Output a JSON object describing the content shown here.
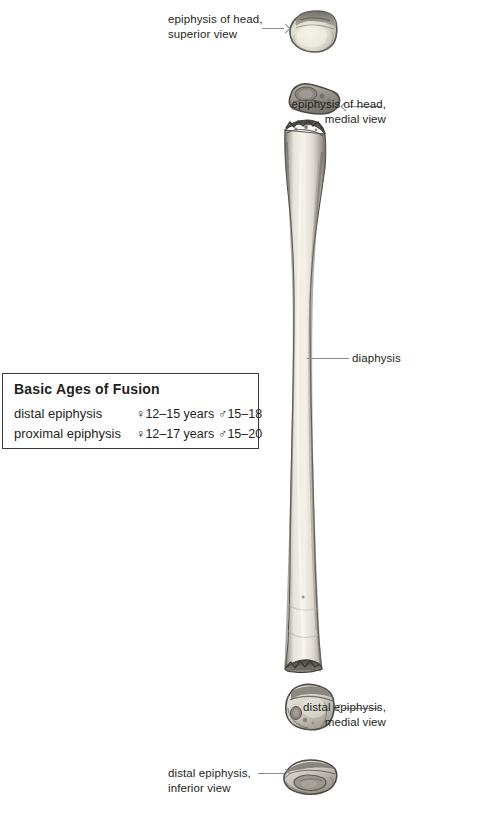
{
  "figure": {
    "background_color": "#ffffff",
    "ink_color": "#231f20",
    "leader_color": "#8c8c8c"
  },
  "labels": [
    {
      "id": "epiphysis-head-superior",
      "text": "epiphysis of head,\nsuperior view",
      "align": "left",
      "x": 168,
      "y": 12,
      "leader": {
        "x": 262,
        "y": 28,
        "length": 22,
        "arrow": "right"
      }
    },
    {
      "id": "epiphysis-head-medial",
      "text": "epiphysis of head,\nmedial view",
      "align": "right",
      "x": 386,
      "y": 97,
      "leader": {
        "x": 348,
        "y": 106,
        "length": 33,
        "arrow": "left"
      }
    },
    {
      "id": "diaphysis",
      "text": "diaphysis",
      "align": "left",
      "x": 352,
      "y": 351,
      "leader": {
        "x": 307,
        "y": 358,
        "length": 42,
        "arrow": "none"
      }
    },
    {
      "id": "distal-epiphysis-medial",
      "text": "distal epiphysis,\nmedial view",
      "align": "right",
      "x": 386,
      "y": 700,
      "leader": {
        "x": 343,
        "y": 708,
        "length": 36,
        "arrow": "left"
      }
    },
    {
      "id": "distal-epiphysis-inferior",
      "text": "distal epiphysis,\ninferior view",
      "align": "left",
      "x": 168,
      "y": 766,
      "leader": {
        "x": 258,
        "y": 773,
        "length": 26,
        "arrow": "right"
      }
    }
  ],
  "fusion_box": {
    "title": "Basic Ages of Fusion",
    "female_symbol": "♀",
    "male_symbol": "♂",
    "rows": [
      {
        "name": "distal epiphysis",
        "female": "♀12–15 years",
        "male": "♂15–18"
      },
      {
        "name": "proximal epiphysis",
        "female": "♀12–17 years",
        "male": "♂15–20"
      }
    ]
  },
  "bone_parts": [
    {
      "id": "head-epiphysis-superior",
      "name": "epiphysis of head, superior view",
      "x": 288,
      "y": 8
    },
    {
      "id": "head-epiphysis-medial",
      "name": "epiphysis of head, medial view",
      "x": 284,
      "y": 82
    },
    {
      "id": "diaphysis-shaft",
      "name": "diaphysis",
      "x": 276,
      "y": 118
    },
    {
      "id": "distal-epiphysis-medial",
      "name": "distal epiphysis, medial view",
      "x": 283,
      "y": 682
    },
    {
      "id": "distal-epiphysis-inferior",
      "name": "distal epiphysis, inferior view",
      "x": 281,
      "y": 757
    }
  ]
}
